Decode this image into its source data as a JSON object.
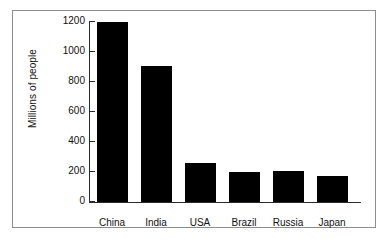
{
  "chart_data": {
    "type": "bar",
    "title": "",
    "xlabel": "",
    "ylabel": "Millions of people",
    "categories": [
      "China",
      "India",
      "USA",
      "Brazil",
      "Russia",
      "Japan"
    ],
    "values": [
      1200,
      910,
      260,
      200,
      205,
      175
    ],
    "ylim": [
      0,
      1200
    ],
    "yticks": [
      0,
      200,
      400,
      600,
      800,
      1000,
      1200
    ],
    "ytick_labels": [
      "0",
      "200",
      "400",
      "600",
      "800",
      "1000",
      "1200"
    ],
    "grid": false,
    "legend": false,
    "bar_color": "#000000",
    "axis_color": "#2a2a2a",
    "background": "#ffffff",
    "frame_color": "#8d8d8d"
  }
}
